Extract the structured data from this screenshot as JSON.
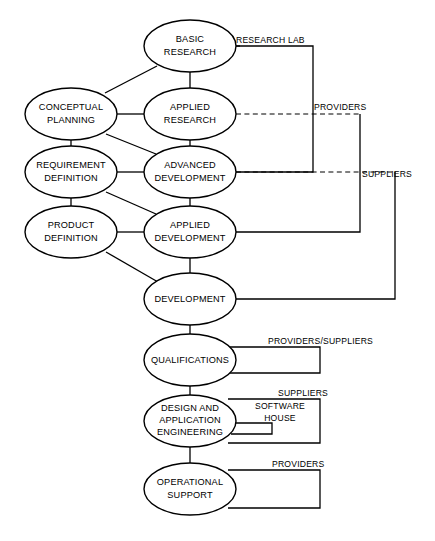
{
  "diagram": {
    "type": "flow-diagram",
    "width": 435,
    "height": 541,
    "background_color": "#ffffff",
    "stroke_color": "#000000",
    "nodes": [
      {
        "id": "basic-research",
        "label_line1": "BASIC",
        "label_line2": "RESEARCH",
        "cx": 190,
        "cy": 46,
        "rx": 46,
        "ry": 26,
        "column": "center"
      },
      {
        "id": "conceptual-planning",
        "label_line1": "CONCEPTUAL",
        "label_line2": "PLANNING",
        "cx": 71,
        "cy": 114,
        "rx": 46,
        "ry": 26,
        "column": "left"
      },
      {
        "id": "applied-research",
        "label_line1": "APPLIED",
        "label_line2": "RESEARCH",
        "cx": 190,
        "cy": 114,
        "rx": 46,
        "ry": 26,
        "column": "center"
      },
      {
        "id": "requirement-definition",
        "label_line1": "REQUIREMENT",
        "label_line2": "DEFINITION",
        "cx": 71,
        "cy": 172,
        "rx": 46,
        "ry": 26,
        "column": "left"
      },
      {
        "id": "advanced-development",
        "label_line1": "ADVANCED",
        "label_line2": "DEVELOPMENT",
        "cx": 190,
        "cy": 172,
        "rx": 46,
        "ry": 26,
        "column": "center"
      },
      {
        "id": "product-definition",
        "label_line1": "PRODUCT",
        "label_line2": "DEFINITION",
        "cx": 71,
        "cy": 232,
        "rx": 46,
        "ry": 26,
        "column": "left"
      },
      {
        "id": "applied-development",
        "label_line1": "APPLIED",
        "label_line2": "DEVELOPMENT",
        "cx": 190,
        "cy": 232,
        "rx": 46,
        "ry": 26,
        "column": "center"
      },
      {
        "id": "development",
        "label_line1": "DEVELOPMENT",
        "label_line2": "",
        "cx": 190,
        "cy": 299,
        "rx": 46,
        "ry": 26,
        "column": "center"
      },
      {
        "id": "qualifications",
        "label_line1": "QUALIFICATIONS",
        "label_line2": "",
        "cx": 190,
        "cy": 360,
        "rx": 46,
        "ry": 26,
        "column": "center"
      },
      {
        "id": "design-application-engineering",
        "label_line1": "DESIGN  AND",
        "label_line2": "APPLICATION",
        "label_line3": "ENGINEERING",
        "cx": 190,
        "cy": 421,
        "rx": 46,
        "ry": 26,
        "column": "center"
      },
      {
        "id": "operational-support",
        "label_line1": "OPERATIONAL",
        "label_line2": "SUPPORT",
        "cx": 190,
        "cy": 489,
        "rx": 46,
        "ry": 26,
        "column": "center"
      }
    ],
    "bracket_labels": [
      {
        "id": "research-lab",
        "text": "RESEARCH  LAB",
        "x": 236,
        "y": 43
      },
      {
        "id": "providers-top",
        "text": "PROVIDERS",
        "x": 314,
        "y": 110
      },
      {
        "id": "suppliers-mid",
        "text": "SUPPLIERS",
        "x": 362,
        "y": 177
      },
      {
        "id": "providers-suppliers",
        "text": "PROVIDERS/SUPPLIERS",
        "x": 268,
        "y": 344
      },
      {
        "id": "suppliers-lower",
        "text": "SUPPLIERS",
        "x": 278,
        "y": 396
      },
      {
        "id": "software-house-line1",
        "text": "SOFTWARE",
        "x": 280,
        "y": 406
      },
      {
        "id": "software-house-line2",
        "text": "HOUSE",
        "x": 280,
        "y": 418
      },
      {
        "id": "providers-bottom",
        "text": "PROVIDERS",
        "x": 272,
        "y": 467
      }
    ],
    "edges": [
      {
        "id": "conceptual-to-basic",
        "style": "solid",
        "from": "conceptual-planning",
        "to": "basic-research"
      },
      {
        "id": "conceptual-to-applied-research",
        "style": "solid",
        "from": "conceptual-planning",
        "to": "applied-research"
      },
      {
        "id": "conceptual-to-requirement",
        "style": "solid",
        "from": "conceptual-planning",
        "to": "requirement-definition"
      },
      {
        "id": "conceptual-to-advanced",
        "style": "solid",
        "from": "conceptual-planning",
        "to": "advanced-development"
      },
      {
        "id": "basic-to-applied-research",
        "style": "solid",
        "from": "basic-research",
        "to": "applied-research"
      },
      {
        "id": "applied-research-to-advanced",
        "style": "solid",
        "from": "applied-research",
        "to": "advanced-development"
      },
      {
        "id": "requirement-to-advanced",
        "style": "solid",
        "from": "requirement-definition",
        "to": "advanced-development"
      },
      {
        "id": "requirement-to-product",
        "style": "solid",
        "from": "requirement-definition",
        "to": "product-definition"
      },
      {
        "id": "requirement-to-applied-dev",
        "style": "solid",
        "from": "requirement-definition",
        "to": "applied-development"
      },
      {
        "id": "advanced-to-applied-dev",
        "style": "solid",
        "from": "advanced-development",
        "to": "applied-development"
      },
      {
        "id": "product-to-applied-dev",
        "style": "solid",
        "from": "product-definition",
        "to": "applied-development"
      },
      {
        "id": "product-to-development",
        "style": "solid",
        "from": "product-definition",
        "to": "development"
      },
      {
        "id": "applied-dev-to-development",
        "style": "solid",
        "from": "applied-development",
        "to": "development"
      },
      {
        "id": "development-to-qualifications",
        "style": "solid",
        "from": "development",
        "to": "qualifications"
      },
      {
        "id": "qualifications-to-design",
        "style": "solid",
        "from": "qualifications",
        "to": "design-application-engineering"
      },
      {
        "id": "design-to-operational",
        "style": "solid",
        "from": "design-application-engineering",
        "to": "operational-support"
      },
      {
        "id": "basic-to-research-lab",
        "style": "solid",
        "from": "basic-research",
        "to": "research-lab-bracket"
      },
      {
        "id": "applied-research-to-providers",
        "style": "dashed",
        "from": "applied-research",
        "to": "providers-bracket"
      },
      {
        "id": "advanced-to-research-lab",
        "style": "solid",
        "from": "advanced-development",
        "to": "research-lab-bracket"
      },
      {
        "id": "advanced-to-suppliers",
        "style": "dashed",
        "from": "advanced-development",
        "to": "suppliers-bracket"
      },
      {
        "id": "applied-dev-to-providers",
        "style": "solid",
        "from": "applied-development",
        "to": "providers-bracket"
      },
      {
        "id": "development-to-suppliers",
        "style": "solid",
        "from": "development",
        "to": "suppliers-bracket"
      },
      {
        "id": "qualifications-to-providers-suppliers",
        "style": "solid",
        "from": "qualifications",
        "to": "providers-suppliers-bracket"
      },
      {
        "id": "design-to-suppliers-lower",
        "style": "solid",
        "from": "design-application-engineering",
        "to": "suppliers-lower-bracket"
      },
      {
        "id": "design-to-software-house",
        "style": "solid",
        "from": "design-application-engineering",
        "to": "software-house-bracket"
      },
      {
        "id": "operational-to-providers",
        "style": "solid",
        "from": "operational-support",
        "to": "providers-bottom-bracket"
      }
    ]
  }
}
